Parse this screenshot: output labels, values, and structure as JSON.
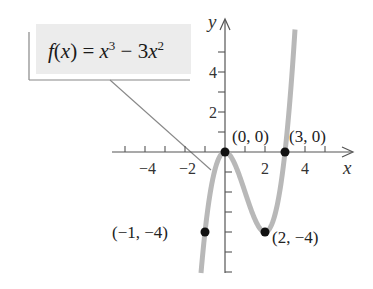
{
  "chart_data": {
    "type": "line",
    "title": "",
    "function_label": "f(x) = x³ − 3x²",
    "function_parts": {
      "lhs": "f(x) = x",
      "exp1": "3",
      "mid": " − 3x",
      "exp2": "2"
    },
    "xlabel": "x",
    "ylabel": "y",
    "xlim": [
      -5.5,
      5.5
    ],
    "ylim": [
      -6,
      6.5
    ],
    "x_ticks": [
      -5,
      -4,
      -3,
      -2,
      -1,
      1,
      2,
      3,
      4,
      5
    ],
    "y_ticks": [
      -6,
      -5,
      -4,
      -3,
      -2,
      -1,
      1,
      2,
      3,
      4,
      5
    ],
    "x_tick_labels": [
      {
        "value": -4,
        "label": "−4"
      },
      {
        "value": -2,
        "label": "−2"
      },
      {
        "value": 2,
        "label": "2"
      },
      {
        "value": 4,
        "label": "4"
      }
    ],
    "y_tick_labels": [
      {
        "value": 2,
        "label": "2"
      },
      {
        "value": 4,
        "label": "4"
      }
    ],
    "series": [
      {
        "name": "f(x) = x^3 - 3x^2",
        "x_range": [
          -1.2,
          3.5
        ],
        "x": [
          -1.2,
          -1,
          -0.5,
          0,
          0.5,
          1,
          1.5,
          2,
          2.5,
          3,
          3.5
        ],
        "y": [
          -6.05,
          -4,
          -0.875,
          0,
          -0.625,
          -2,
          -3.375,
          -4,
          -3.125,
          0,
          6.125
        ],
        "color": "#b8b8b8"
      }
    ],
    "points": [
      {
        "x": 0,
        "y": 0,
        "label": "(0, 0)"
      },
      {
        "x": 3,
        "y": 0,
        "label": "(3, 0)"
      },
      {
        "x": -1,
        "y": -4,
        "label": "(−1, −4)"
      },
      {
        "x": 2,
        "y": -4,
        "label": "(2, −4)"
      }
    ],
    "grid": false,
    "legend_position": "top-left callout box"
  },
  "colors": {
    "curve": "#b8b8b8",
    "axis": "#555555",
    "point": "#111111",
    "callout_bg": "#ececec",
    "callout_line": "#888888"
  }
}
